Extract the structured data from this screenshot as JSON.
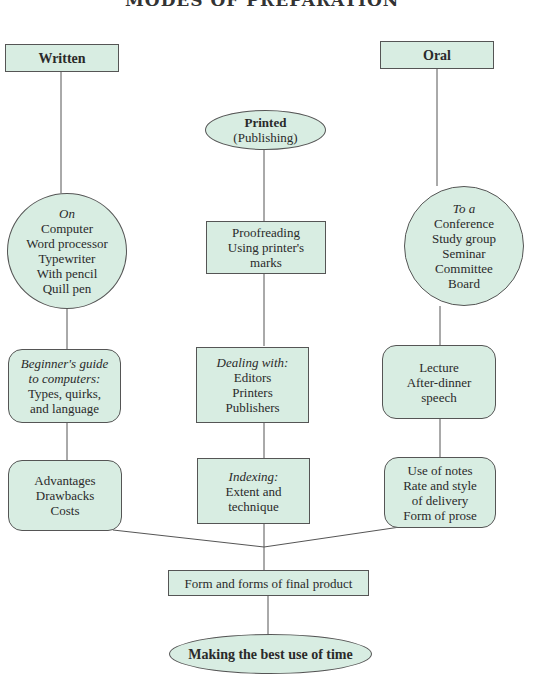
{
  "title": "MODES OF PREPARATION",
  "colors": {
    "node_fill": "#d8ede2",
    "line": "#555555"
  },
  "columns": {
    "written": {
      "header": "Written",
      "media": {
        "intro": "On",
        "items": [
          "Computer",
          "Word processor",
          "Typewriter",
          "With pencil",
          "Quill pen"
        ]
      },
      "guide": {
        "intro": [
          "Beginner's guide",
          "to computers:"
        ],
        "items": [
          "Types, quirks,",
          "and language"
        ]
      },
      "evaluation": {
        "items": [
          "Advantages",
          "Drawbacks",
          "Costs"
        ]
      }
    },
    "printed": {
      "header": "Printed",
      "subheader": "(Publishing)",
      "proofing": {
        "items": [
          "Proofreading",
          "Using printer's",
          "marks"
        ]
      },
      "dealing": {
        "intro": "Dealing with:",
        "items": [
          "Editors",
          "Printers",
          "Publishers"
        ]
      },
      "indexing": {
        "intro": "Indexing:",
        "items": [
          "Extent and",
          "technique"
        ]
      }
    },
    "oral": {
      "header": "Oral",
      "venues": {
        "intro": "To a",
        "items": [
          "Conference",
          "Study group",
          "Seminar",
          "Committee",
          "Board"
        ]
      },
      "types": {
        "items": [
          "Lecture",
          "After-dinner",
          "speech"
        ]
      },
      "delivery": {
        "items": [
          "Use of notes",
          "Rate and style",
          "of delivery",
          "Form of prose"
        ]
      }
    }
  },
  "final_product": "Form and forms of final product",
  "conclusion": "Making the best use of time"
}
